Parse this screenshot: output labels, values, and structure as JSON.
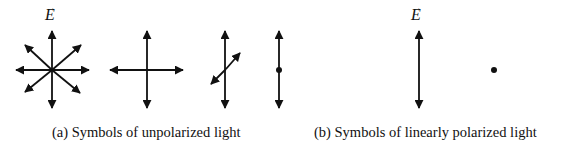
{
  "figure": {
    "panel_a": {
      "caption": "(a) Symbols of unpolarized light",
      "vector_label": "E",
      "vector_arrow": "→",
      "symbols": [
        {
          "name": "star-eight-directions",
          "description": "Eight arrows radiating in all directions"
        },
        {
          "name": "cross-two-directions",
          "description": "Horizontal and vertical double arrows"
        },
        {
          "name": "vertical-plus-diagonal",
          "description": "Vertical double arrow with oblique double arrow"
        },
        {
          "name": "vertical-plus-dot",
          "description": "Vertical double arrow with dot (out of plane)"
        }
      ]
    },
    "panel_b": {
      "caption": "(b) Symbols of linearly polarized light",
      "vector_label": "E",
      "vector_arrow": "→",
      "symbols": [
        {
          "name": "vertical-double-arrow",
          "description": "Polarization in the plane"
        },
        {
          "name": "dot",
          "description": "Polarization perpendicular to the plane"
        }
      ]
    },
    "colors": {
      "stroke": "#111111",
      "background": "#ffffff"
    }
  }
}
